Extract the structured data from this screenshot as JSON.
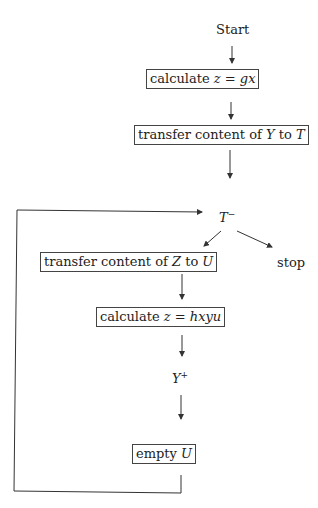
{
  "diagram": {
    "nodes": {
      "start": {
        "label": "Start"
      },
      "calc_gx": {
        "prefix": "calculate ",
        "math": "z = gx"
      },
      "transfer_yt": {
        "prefix": "transfer content of ",
        "var1": "Y",
        "mid": " to ",
        "var2": "T"
      },
      "t_minus": {
        "base": "T",
        "sup": "−"
      },
      "stop": {
        "label": "stop"
      },
      "transfer_zu": {
        "prefix": "transfer content of ",
        "var1": "Z",
        "mid": " to ",
        "var2": "U"
      },
      "calc_hxyu": {
        "prefix": "calculate ",
        "math": "z = hxyu"
      },
      "y_plus": {
        "base": "Y",
        "sup": "+"
      },
      "empty_u": {
        "prefix": "empty ",
        "var": "U"
      }
    },
    "colors": {
      "line": "#333333",
      "box_border": "#444444"
    }
  }
}
